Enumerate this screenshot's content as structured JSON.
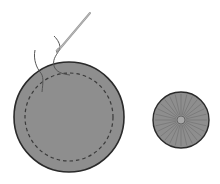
{
  "illustration": {
    "description": "Sewing a running stitch around a fabric circle, then gathering it into a yo-yo",
    "colors": {
      "fabric": "#8e8e8e",
      "outline": "#2a2a2a",
      "stitch": "#3a3a3a",
      "thread": "#555555",
      "needle": "#9a9a9a",
      "background": "#ffffff"
    },
    "fabric_circle": {
      "cx": 69,
      "cy": 117,
      "r": 55
    },
    "stitch_line": {
      "cx": 69,
      "cy": 117,
      "r": 44
    },
    "gathered_yoyo": {
      "cx": 181,
      "cy": 120,
      "r": 28,
      "center_r": 4,
      "pleats": 28
    }
  }
}
